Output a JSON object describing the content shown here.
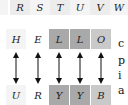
{
  "top_row": {
    "letters": [
      "R",
      "S",
      "T",
      "U",
      "V",
      "W"
    ]
  },
  "source_row": {
    "letters": [
      "H",
      "E",
      "L",
      "L",
      "O"
    ]
  },
  "target_row": {
    "letters": [
      "U",
      "R",
      "Y",
      "Y",
      "B"
    ]
  },
  "arrows": {
    "count": 5,
    "type": "bidirectional-vertical"
  },
  "side_text": {
    "lines": [
      "c",
      "p",
      "i",
      "a"
    ]
  },
  "colors": {
    "light_cell": "#ececec",
    "dark_cell": "#a9a9a9",
    "medium_cell": "#c9c9c9",
    "arrow": "#111111"
  }
}
